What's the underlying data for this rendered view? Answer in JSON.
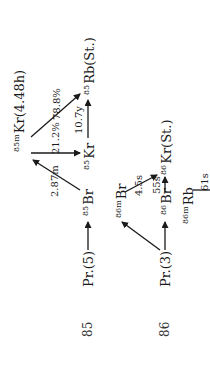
{
  "diagram": {
    "rows": [
      {
        "mass_number": "85",
        "precursor": "Pr.(5)"
      },
      {
        "mass_number": "86",
        "precursor": "Pr.(3)"
      }
    ],
    "nuclides": {
      "br85": {
        "prefix": "85",
        "symbol": "Br"
      },
      "kr85m": {
        "prefix": "85m",
        "symbol": "Kr(4.48h)"
      },
      "kr85": {
        "prefix": "85",
        "symbol": "Kr"
      },
      "rb85": {
        "prefix": "85",
        "symbol": "Rb(St.)"
      },
      "br86m": {
        "prefix": "86m",
        "symbol": "Br"
      },
      "br86": {
        "prefix": "86",
        "symbol": "Br"
      },
      "kr86": {
        "prefix": "86",
        "symbol": "Kr(St.)"
      },
      "rb86m": {
        "prefix": "86m",
        "symbol": "Rb"
      }
    },
    "transitions": {
      "br85_to_kr85m": "2.87m",
      "kr85m_to_rb85": "78.8%",
      "kr85m_to_kr85": "21.2%",
      "kr85_to_rb85": "10.7y",
      "br86m_to_kr86": "4.5s",
      "br86_to_kr86": "55s",
      "rb86m": "61s"
    },
    "colors": {
      "ink": "#1a1a1a",
      "background": "#ffffff"
    }
  }
}
